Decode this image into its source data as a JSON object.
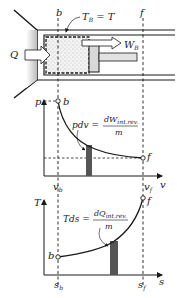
{
  "cylinder": {
    "boundary_left_label": "b",
    "boundary_right_label": "f",
    "boundary_temp_label_main": "T",
    "boundary_temp_label_sub": "B",
    "boundary_temp_label_eq": " = T",
    "heat_label": "Q",
    "work_label_main": "W",
    "work_label_sub": "B"
  },
  "pv_diagram": {
    "y_axis_label": "p",
    "x_axis_label": "v",
    "state_initial": "b",
    "state_final": "f",
    "x_tick_initial_main": "v",
    "x_tick_initial_sub": "b",
    "x_tick_final_main": "v",
    "x_tick_final_sub": "f",
    "equation_lhs": "pdv = ",
    "equation_numerator_main": "dW",
    "equation_numerator_sub": "int.rev.",
    "equation_denominator": "m"
  },
  "ts_diagram": {
    "y_axis_label": "T",
    "x_axis_label": "s",
    "state_initial": "b",
    "state_final": "f",
    "x_tick_initial_main": "s",
    "x_tick_initial_sub": "b",
    "x_tick_final_main": "s",
    "x_tick_final_sub": "f",
    "equation_lhs": "Tds = ",
    "equation_numerator_main": "dQ",
    "equation_numerator_sub": "int.rev.",
    "equation_denominator": "m"
  },
  "colors": {
    "line": "#1a1a1a",
    "strip": "#555555",
    "gas_fill": "#f3f3f3",
    "piston": "#cfcfcf"
  }
}
